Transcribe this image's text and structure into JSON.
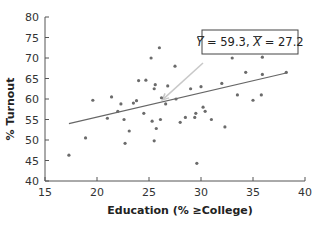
{
  "chart_data": {
    "type": "scatter",
    "title": "",
    "xlabel": "Education (% ≥College)",
    "ylabel": "% Turnout",
    "xlim": [
      15,
      40
    ],
    "ylim": [
      40,
      80
    ],
    "xticks": [
      15,
      20,
      25,
      30,
      35,
      40
    ],
    "yticks": [
      40,
      45,
      50,
      55,
      60,
      65,
      70,
      75,
      80
    ],
    "grid": false,
    "legend": null,
    "series": [
      {
        "name": "States",
        "points": [
          [
            17.3,
            46.3
          ],
          [
            18.9,
            50.5
          ],
          [
            19.6,
            59.7
          ],
          [
            21.0,
            55.3
          ],
          [
            21.4,
            60.5
          ],
          [
            22.0,
            57.0
          ],
          [
            22.3,
            58.8
          ],
          [
            22.6,
            55.0
          ],
          [
            22.7,
            49.2
          ],
          [
            23.1,
            52.2
          ],
          [
            23.5,
            59.0
          ],
          [
            23.8,
            59.6
          ],
          [
            24.0,
            64.5
          ],
          [
            24.5,
            56.5
          ],
          [
            24.7,
            64.6
          ],
          [
            25.2,
            70.0
          ],
          [
            25.3,
            54.6
          ],
          [
            25.5,
            62.5
          ],
          [
            25.6,
            63.5
          ],
          [
            25.5,
            49.8
          ],
          [
            25.7,
            52.8
          ],
          [
            26.0,
            72.5
          ],
          [
            26.2,
            60.3
          ],
          [
            26.1,
            55.0
          ],
          [
            26.6,
            58.8
          ],
          [
            26.8,
            63.2
          ],
          [
            27.5,
            68.0
          ],
          [
            27.6,
            60.0
          ],
          [
            28.0,
            54.3
          ],
          [
            28.5,
            55.5
          ],
          [
            29.0,
            62.5
          ],
          [
            29.4,
            55.5
          ],
          [
            29.5,
            56.5
          ],
          [
            29.6,
            44.3
          ],
          [
            30.0,
            63.0
          ],
          [
            30.2,
            58.0
          ],
          [
            30.4,
            57.0
          ],
          [
            31.0,
            55.0
          ],
          [
            32.0,
            63.8
          ],
          [
            32.3,
            53.2
          ],
          [
            33.0,
            70.0
          ],
          [
            33.5,
            61.0
          ],
          [
            34.3,
            66.5
          ],
          [
            35.0,
            59.7
          ],
          [
            35.9,
            66.0
          ],
          [
            35.8,
            61.0
          ],
          [
            35.9,
            70.2
          ],
          [
            38.2,
            66.5
          ]
        ]
      }
    ],
    "regression_line": {
      "x": [
        17.3,
        38.3
      ],
      "y": [
        54.0,
        66.4
      ]
    },
    "annotations": [
      {
        "text": "Ȳ = 59.3, X̄ = 27.2",
        "y_mean": 59.3,
        "x_mean": 27.2,
        "arrow_to": [
          26.0,
          59.3
        ]
      }
    ]
  },
  "labels": {
    "annotation": "Y̅ = 59.3, X̅ = 27.2",
    "y_mean_label": "Y",
    "y_mean_value": " = 59.3, ",
    "x_mean_label": "X",
    "x_mean_value": " = 27.2"
  },
  "colors": {
    "axis": "#555555",
    "point": "#6b6b6b",
    "regression": "#666666",
    "arrow": "#c8c8c8",
    "box_border": "#444444"
  }
}
